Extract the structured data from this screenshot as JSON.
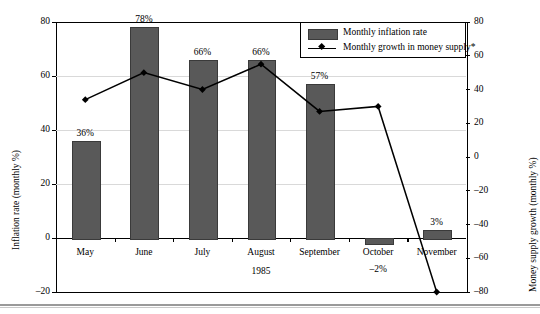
{
  "chart_data": {
    "type": "bar",
    "title": "",
    "subtitle": "",
    "categories": [
      "May",
      "June",
      "July",
      "August",
      "September",
      "October",
      "November"
    ],
    "xlabel": "1985",
    "ylabel": "Inflation rate (monthly %)",
    "ylabel_right": "Money supply growth (monthly %)",
    "ylim": [
      -20,
      80
    ],
    "ylim_right": [
      -80,
      80
    ],
    "yticks": [
      80,
      60,
      40,
      20,
      0,
      -20
    ],
    "ytick_labels": [
      "80",
      "60",
      "40",
      "20",
      "0",
      "–20"
    ],
    "yticks_right": [
      80,
      60,
      40,
      20,
      0,
      -20,
      -40,
      -60,
      -80
    ],
    "ytick_labels_right": [
      "80",
      "60",
      "40",
      "20",
      "0",
      "–20",
      "–40",
      "–60",
      "–80"
    ],
    "grid": true,
    "legend_position": "top-right",
    "series": [
      {
        "name": "Monthly inflation rate",
        "type": "bar",
        "axis": "left",
        "color": "#595959",
        "values": [
          36,
          78,
          66,
          66,
          57,
          -2,
          3
        ],
        "data_labels": [
          "36%",
          "78%",
          "66%",
          "66%",
          "57%",
          "–2%",
          "3%"
        ]
      },
      {
        "name": "Monthly growth in money supply*",
        "type": "line",
        "axis": "right",
        "color": "#000000",
        "marker": "diamond",
        "values": [
          34,
          50,
          40,
          55,
          27,
          30,
          -80
        ]
      }
    ]
  },
  "legend": {
    "items": [
      {
        "label": "Monthly inflation rate",
        "marker": "swatch"
      },
      {
        "label": "Monthly growth in money supply*",
        "marker": "line-diamond"
      }
    ]
  },
  "axes": {
    "left_title": "Inflation rate (monthly %)",
    "right_title": "Money supply growth (monthly %)",
    "x_title": "1985"
  }
}
